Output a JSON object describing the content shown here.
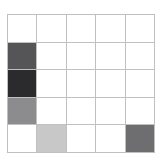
{
  "figure": {
    "background_color": "#ffffff",
    "grid_line_color": "#c0c0c0",
    "empty_cell_color": "#ffffff"
  },
  "chart_data": {
    "type": "heatmap",
    "title": "",
    "xlabel": "",
    "ylabel": "",
    "rows": 5,
    "cols": 5,
    "grid": true,
    "legend": "none",
    "row_labels": [
      "",
      "",
      "",
      "",
      ""
    ],
    "col_labels": [
      "",
      "",
      "",
      "",
      ""
    ],
    "colormap": "grayscale",
    "cells": [
      [
        {
          "row": 1,
          "col": 1,
          "color": "#ffffff",
          "filled": false
        },
        {
          "row": 1,
          "col": 2,
          "color": "#ffffff",
          "filled": false
        },
        {
          "row": 1,
          "col": 3,
          "color": "#ffffff",
          "filled": false
        },
        {
          "row": 1,
          "col": 4,
          "color": "#ffffff",
          "filled": false
        },
        {
          "row": 1,
          "col": 5,
          "color": "#ffffff",
          "filled": false
        }
      ],
      [
        {
          "row": 2,
          "col": 1,
          "color": "#555558",
          "filled": true
        },
        {
          "row": 2,
          "col": 2,
          "color": "#ffffff",
          "filled": false
        },
        {
          "row": 2,
          "col": 3,
          "color": "#ffffff",
          "filled": false
        },
        {
          "row": 2,
          "col": 4,
          "color": "#ffffff",
          "filled": false
        },
        {
          "row": 2,
          "col": 5,
          "color": "#ffffff",
          "filled": false
        }
      ],
      [
        {
          "row": 3,
          "col": 1,
          "color": "#2b2b2d",
          "filled": true
        },
        {
          "row": 3,
          "col": 2,
          "color": "#ffffff",
          "filled": false
        },
        {
          "row": 3,
          "col": 3,
          "color": "#ffffff",
          "filled": false
        },
        {
          "row": 3,
          "col": 4,
          "color": "#ffffff",
          "filled": false
        },
        {
          "row": 3,
          "col": 5,
          "color": "#ffffff",
          "filled": false
        }
      ],
      [
        {
          "row": 4,
          "col": 1,
          "color": "#8c8c8e",
          "filled": true
        },
        {
          "row": 4,
          "col": 2,
          "color": "#ffffff",
          "filled": false
        },
        {
          "row": 4,
          "col": 3,
          "color": "#ffffff",
          "filled": false
        },
        {
          "row": 4,
          "col": 4,
          "color": "#ffffff",
          "filled": false
        },
        {
          "row": 4,
          "col": 5,
          "color": "#ffffff",
          "filled": false
        }
      ],
      [
        {
          "row": 5,
          "col": 1,
          "color": "#ffffff",
          "filled": false
        },
        {
          "row": 5,
          "col": 2,
          "color": "#c8c8c8",
          "filled": true
        },
        {
          "row": 5,
          "col": 3,
          "color": "#ffffff",
          "filled": false
        },
        {
          "row": 5,
          "col": 4,
          "color": "#ffffff",
          "filled": false
        },
        {
          "row": 5,
          "col": 5,
          "color": "#6e6e70",
          "filled": true
        }
      ]
    ]
  }
}
